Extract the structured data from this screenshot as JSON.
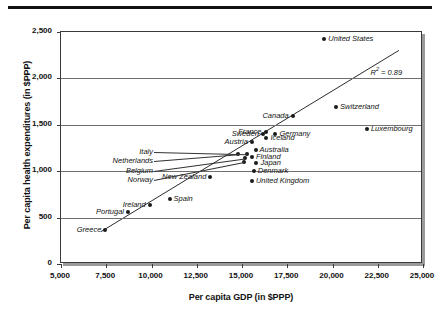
{
  "chart_data": {
    "type": "scatter",
    "title": "",
    "xlabel": "Per capita GDP (in $PPP)",
    "ylabel": "Per capita health expenditures (in $PPP)",
    "xlim": [
      5000,
      25000
    ],
    "ylim": [
      0,
      2500
    ],
    "xticks": [
      "5,000",
      "7,500",
      "10,000",
      "12,500",
      "15,000",
      "17,500",
      "20,000",
      "22,500",
      "25,000"
    ],
    "xtick_values": [
      5000,
      7500,
      10000,
      12500,
      15000,
      17500,
      20000,
      22500,
      25000
    ],
    "yticks": [
      "0",
      "500",
      "1,000",
      "1,500",
      "2,000",
      "2,500"
    ],
    "ytick_values": [
      0,
      500,
      1000,
      1500,
      2000,
      2500
    ],
    "grid": "horizontal",
    "legend": "none",
    "annotation": "R² = 0.89",
    "annotation_r2_value": 0.89,
    "trendline": {
      "type": "linear",
      "x_start": 7200,
      "y_start": 330,
      "x_end": 23800,
      "y_end": 2300
    },
    "points": [
      {
        "label": "Greece",
        "x": 7450,
        "y": 370,
        "label_pos": "left"
      },
      {
        "label": "Portugal",
        "x": 8700,
        "y": 560,
        "label_pos": "left"
      },
      {
        "label": "Ireland",
        "x": 9900,
        "y": 640,
        "label_pos": "left"
      },
      {
        "label": "Spain",
        "x": 11000,
        "y": 700,
        "label_pos": "right"
      },
      {
        "label": "New Zealand",
        "x": 13250,
        "y": 940,
        "label_pos": "left"
      },
      {
        "label": "Norway",
        "x": 15100,
        "y": 1095,
        "label_pos": "leader-left"
      },
      {
        "label": "Belgium",
        "x": 15150,
        "y": 1140,
        "label_pos": "leader-left"
      },
      {
        "label": "Netherlands",
        "x": 14800,
        "y": 1180,
        "label_pos": "leader-left"
      },
      {
        "label": "Italy",
        "x": 15250,
        "y": 1185,
        "label_pos": "leader-left"
      },
      {
        "label": "Austria",
        "x": 15550,
        "y": 1320,
        "label_pos": "left"
      },
      {
        "label": "United Kingdom",
        "x": 15550,
        "y": 890,
        "label_pos": "right"
      },
      {
        "label": "Denmark",
        "x": 15650,
        "y": 1000,
        "label_pos": "right"
      },
      {
        "label": "Finland",
        "x": 15550,
        "y": 1150,
        "label_pos": "right"
      },
      {
        "label": "Australia",
        "x": 15750,
        "y": 1225,
        "label_pos": "right"
      },
      {
        "label": "Japan",
        "x": 15800,
        "y": 1085,
        "label_pos": "right"
      },
      {
        "label": "Sweden",
        "x": 16150,
        "y": 1405,
        "label_pos": "left"
      },
      {
        "label": "France",
        "x": 16300,
        "y": 1420,
        "label_pos": "left"
      },
      {
        "label": "Iceland",
        "x": 16350,
        "y": 1355,
        "label_pos": "right"
      },
      {
        "label": "Germany",
        "x": 16850,
        "y": 1405,
        "label_pos": "right"
      },
      {
        "label": "Canada",
        "x": 17800,
        "y": 1590,
        "label_pos": "left"
      },
      {
        "label": "United States",
        "x": 19550,
        "y": 2420,
        "label_pos": "right"
      },
      {
        "label": "Switzerland",
        "x": 20200,
        "y": 1690,
        "label_pos": "right"
      },
      {
        "label": "Luxembourg",
        "x": 21900,
        "y": 1455,
        "label_pos": "right"
      }
    ]
  },
  "colors": {
    "marker": "#1a1a1a",
    "axis": "#3a3a3a",
    "grid": "#6f6f6f",
    "text": "#111111",
    "background": "#ffffff",
    "rule": "#111111"
  }
}
